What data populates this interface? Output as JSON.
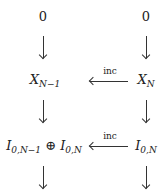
{
  "diagram": {
    "nodes": {
      "top_left": "0",
      "top_right": "0",
      "mid_left_base": "X",
      "mid_left_sub": "N−1",
      "mid_right_base": "X",
      "mid_right_sub": "N",
      "low_left_a_base": "I",
      "low_left_a_sub": "0,N−1",
      "low_left_op": "⊕",
      "low_left_b_base": "I",
      "low_left_b_sub": "0,N",
      "low_right_base": "I",
      "low_right_sub": "0,N"
    },
    "arrows": {
      "row1_label": "inc",
      "row2_label": "inc"
    }
  }
}
